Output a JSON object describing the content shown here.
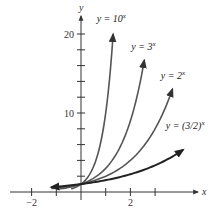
{
  "chart_data": {
    "type": "line",
    "title": "",
    "xlabel": "x",
    "ylabel": "y",
    "xlim": [
      -2.5,
      4.6
    ],
    "ylim": [
      -1.2,
      22.6
    ],
    "x_ticks": [
      -2,
      -1,
      0,
      1,
      2,
      3
    ],
    "x_tick_labels": {
      "-2": "−2",
      "2": "2"
    },
    "y_ticks": [
      2,
      4,
      6,
      8,
      10,
      12,
      14,
      16,
      18,
      20
    ],
    "y_tick_labels": {
      "10": "10",
      "20": "20"
    },
    "grid": false,
    "series": [
      {
        "name": "y = 10^x",
        "base": 10,
        "x_range": [
          -0.4,
          1.3
        ],
        "color": "#555555"
      },
      {
        "name": "y = 3^x",
        "base": 3,
        "x_range": [
          -1.0,
          2.56
        ],
        "color": "#555555"
      },
      {
        "name": "y = 2^x",
        "base": 2,
        "x_range": [
          -1.2,
          3.7
        ],
        "color": "#555555"
      },
      {
        "name": "y = (3/2)^x",
        "base": 1.5,
        "x_range": [
          -1.2,
          4.13
        ],
        "color": "#222222"
      }
    ],
    "annotations": [
      {
        "text": "y = 10",
        "sup": "x",
        "x": 1.2,
        "y": 21.5
      },
      {
        "text": "y = 3",
        "sup": "x",
        "x": 2.6,
        "y": 18.0
      },
      {
        "text": "y = 2",
        "sup": "x",
        "x": 3.8,
        "y": 14.3
      },
      {
        "text": "y = (3/2)",
        "sup": "x",
        "x": 4.0,
        "y": 8.0
      }
    ]
  }
}
